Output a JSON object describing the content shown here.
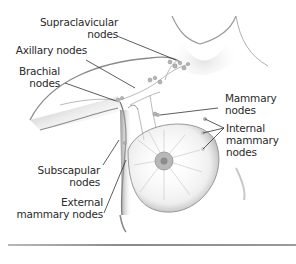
{
  "figure": {
    "labels": {
      "supraclavicular": [
        "Supraclavicular",
        "nodes"
      ],
      "axillary": [
        "Axillary nodes"
      ],
      "brachial": [
        "Brachial",
        "nodes"
      ],
      "mammary": [
        "Mammary",
        "nodes"
      ],
      "internal_mammary": [
        "Internal",
        "mammary",
        "nodes"
      ],
      "subscapular": [
        "Subscapular",
        "nodes"
      ],
      "external_mammary": [
        "External",
        "mammary nodes"
      ]
    },
    "colors": {
      "text": "#2a2a2a",
      "leader_line": "#333333",
      "skin_shade": "#8c8c8c",
      "node": "#9a9a9a",
      "rule": "#999999"
    }
  }
}
